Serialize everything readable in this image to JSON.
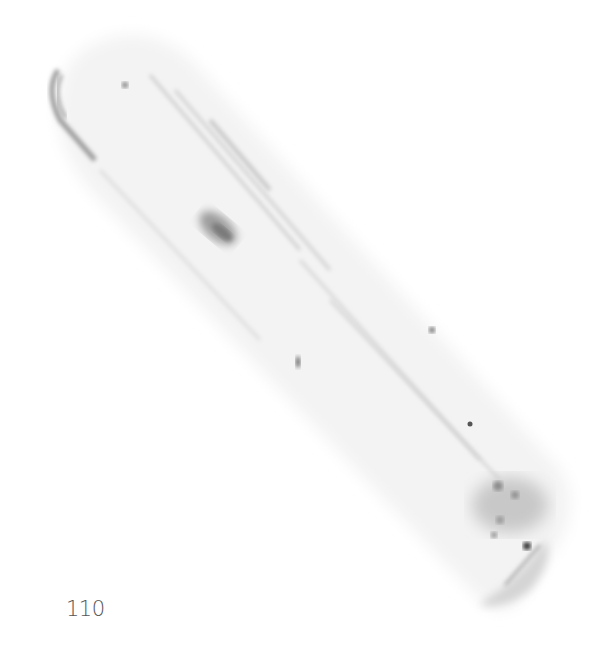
{
  "figure": {
    "panel_label": "110",
    "colors": {
      "background": "#ffffff",
      "label": "#555555",
      "specimen_light": "#e6e6e6",
      "specimen_mid": "#b5b5b5",
      "specimen_dark": "#3a3a3a"
    }
  }
}
